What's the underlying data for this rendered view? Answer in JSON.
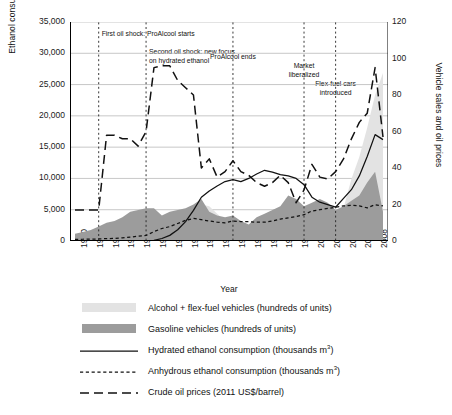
{
  "chart_data": {
    "type": "area",
    "title": "",
    "xlabel": "Year",
    "ylabel_left": "Ethanol consumption",
    "ylabel_right": "Vehicle sales and oil prices",
    "ylim_left": [
      0,
      35000
    ],
    "ylim_right": [
      0,
      120
    ],
    "ytick_left": [
      "0",
      "5,000",
      "10,000",
      "15,000",
      "20,000",
      "25,000",
      "30,000",
      "35,000"
    ],
    "ytick_right": [
      "0",
      "20",
      "40",
      "60",
      "80",
      "100",
      "120"
    ],
    "grid": true,
    "legend_position": "below",
    "x": [
      1970,
      1971,
      1972,
      1973,
      1974,
      1975,
      1976,
      1977,
      1978,
      1979,
      1980,
      1981,
      1982,
      1983,
      1984,
      1985,
      1986,
      1987,
      1988,
      1989,
      1990,
      1991,
      1992,
      1993,
      1994,
      1995,
      1996,
      1997,
      1998,
      1999,
      2000,
      2001,
      2002,
      2003,
      2004,
      2005,
      2006,
      2007,
      2008,
      2009
    ],
    "xtick_labels": [
      "1970",
      "1972",
      "1974",
      "1976",
      "1978",
      "1980",
      "1982",
      "1984",
      "1986",
      "1988",
      "1990",
      "1992",
      "1994",
      "1996",
      "1998",
      "2000",
      "2002",
      "2004",
      "2006",
      "2008"
    ],
    "series": [
      {
        "name": "Alcohol + flex-fuel vehicles (hundreds of units)",
        "key": "alcohol_flexfuel_vehicles",
        "type": "area",
        "axis": "right",
        "color": "#e3e3e3",
        "values": [
          0,
          0,
          0,
          0,
          0,
          0,
          0,
          0,
          0,
          1,
          3,
          6,
          8,
          9,
          10,
          18,
          20,
          19,
          15,
          11,
          3,
          2,
          2,
          3,
          2,
          1,
          1,
          1,
          1,
          1,
          1,
          2,
          3,
          8,
          18,
          34,
          46,
          62,
          80,
          92
        ]
      },
      {
        "name": "Gasoline vehicles (hundreds of units)",
        "key": "gasoline_vehicles",
        "type": "area",
        "axis": "right",
        "color": "#9c9c9c",
        "values": [
          4,
          5,
          6,
          8,
          10,
          11,
          13,
          16,
          17,
          18,
          18,
          14,
          16,
          17,
          18,
          20,
          23,
          16,
          14,
          13,
          14,
          11,
          9,
          13,
          15,
          17,
          19,
          25,
          23,
          19,
          21,
          23,
          21,
          17,
          19,
          22,
          25,
          32,
          38,
          16
        ]
      },
      {
        "name": "Hydrated ethanol consumption (thousands m³)",
        "key": "hydrated_ethanol",
        "type": "line",
        "axis": "left",
        "style": "solid",
        "color": "#111111",
        "values": [
          0,
          0,
          0,
          0,
          0,
          0,
          0,
          0,
          0,
          0,
          100,
          400,
          900,
          1800,
          3100,
          4900,
          7000,
          8000,
          8800,
          9500,
          9800,
          9500,
          10000,
          10700,
          11300,
          11000,
          10600,
          10400,
          10000,
          9000,
          7000,
          6200,
          5800,
          5400,
          6800,
          8200,
          10400,
          13500,
          17000,
          16200
        ]
      },
      {
        "name": "Anhydrous ethanol consumption (thousands m³)",
        "key": "anhydrous_ethanol",
        "type": "line",
        "axis": "left",
        "style": "dotted",
        "color": "#111111",
        "values": [
          250,
          280,
          300,
          330,
          380,
          420,
          500,
          620,
          760,
          900,
          1500,
          2000,
          2300,
          2800,
          3300,
          3600,
          3400,
          3200,
          3000,
          2900,
          3200,
          3100,
          3100,
          3000,
          3000,
          3200,
          3500,
          3700,
          3900,
          4200,
          4800,
          5000,
          5200,
          5400,
          5600,
          5700,
          5600,
          5300,
          5800,
          5600
        ]
      },
      {
        "name": "Crude oil prices (2011 US$/barrel)",
        "key": "crude_oil_prices",
        "type": "line",
        "axis": "right",
        "style": "dashed",
        "color": "#111111",
        "values": [
          17,
          17,
          17,
          17,
          58,
          58,
          56,
          56,
          52,
          60,
          95,
          96,
          96,
          88,
          84,
          80,
          40,
          45,
          35,
          38,
          44,
          38,
          36,
          32,
          30,
          32,
          36,
          32,
          21,
          28,
          42,
          35,
          34,
          38,
          45,
          56,
          65,
          70,
          95,
          57
        ]
      }
    ],
    "annotations": [
      {
        "text": "First oil shock: ProAlcool starts",
        "year": 1973,
        "align": "left"
      },
      {
        "text": "Second oil shock: new focus\non hydrated ethanol",
        "year": 1979,
        "align": "left"
      },
      {
        "text": "ProAlcool ends",
        "year": 1990,
        "align": "center"
      },
      {
        "text": "Market\nliberalized",
        "year": 1999,
        "align": "center"
      },
      {
        "text": "Flex-fuel cars\nintroduced",
        "year": 2003,
        "align": "center"
      }
    ],
    "vlines": [
      1973,
      1979,
      1990,
      1999,
      2003
    ]
  },
  "legend": {
    "items": [
      {
        "label": "Alcohol + flex-fuel vehicles (hundreds of units)",
        "key": "swatch-light",
        "kind": "swatch",
        "color": "#e3e3e3"
      },
      {
        "label": "Gasoline vehicles (hundreds of units)",
        "key": "swatch-dark",
        "kind": "swatch",
        "color": "#9c9c9c"
      },
      {
        "label": "Hydrated ethanol consumption (thousands m³)",
        "key": "line-solid",
        "kind": "line-solid",
        "color": "#111111"
      },
      {
        "label": "Anhydrous ethanol consumption (thousands m³)",
        "key": "line-dotted",
        "kind": "line-dotted",
        "color": "#111111"
      },
      {
        "label": "Crude oil prices (2011 US$/barrel)",
        "key": "line-dashed",
        "kind": "line-dashed",
        "color": "#111111"
      }
    ]
  }
}
